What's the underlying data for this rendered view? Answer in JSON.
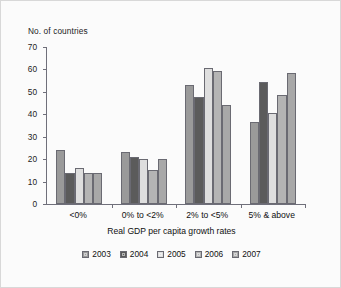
{
  "figure": {
    "background_color": "#fbfbfb",
    "border_color": "#d8d8d8",
    "axis_color": "#6f6f7a",
    "bar_border_color": "#6a6a72"
  },
  "chart_data": {
    "type": "bar",
    "title": "",
    "ylabel": "No. of countries",
    "xlabel": "Real GDP per capita growth rates",
    "ylim": [
      0,
      70
    ],
    "yticks": [
      0,
      10,
      20,
      30,
      40,
      50,
      60,
      70
    ],
    "ytick_labels": [
      "0",
      "10",
      "20",
      "30",
      "40",
      "50",
      "60",
      "70"
    ],
    "grid": false,
    "legend_position": "bottom",
    "categories": [
      "<0%",
      "0% to <2%",
      "2% to <5%",
      "5% & above"
    ],
    "series": [
      {
        "name": "2003",
        "color": "#9a9a9a",
        "values": [
          24,
          23,
          53,
          36.5
        ]
      },
      {
        "name": "2004",
        "color": "#5b5b5b",
        "values": [
          14,
          21,
          47.5,
          54.5
        ]
      },
      {
        "name": "2005",
        "color": "#dedede",
        "values": [
          16,
          20,
          60.5,
          40.5
        ]
      },
      {
        "name": "2006",
        "color": "#b4b4b4",
        "values": [
          14,
          15,
          59.5,
          48.5
        ]
      },
      {
        "name": "2007",
        "color": "#a8a8a8",
        "values": [
          14,
          20,
          44,
          58.5
        ]
      }
    ]
  }
}
